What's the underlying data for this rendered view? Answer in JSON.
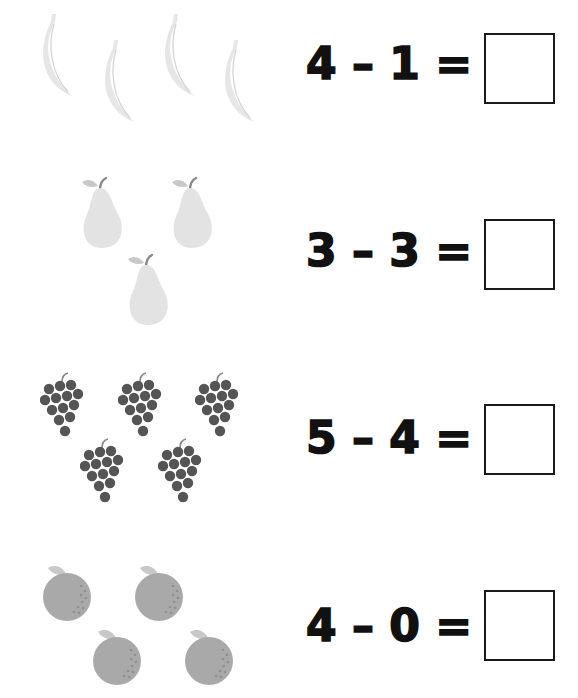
{
  "worksheet": {
    "rows": [
      {
        "fruit": "banana-icon",
        "count": 4,
        "equation": "4 – 1 =",
        "answer": ""
      },
      {
        "fruit": "pear-icon",
        "count": 3,
        "equation": "3 – 3 =",
        "answer": ""
      },
      {
        "fruit": "grapes-icon",
        "count": 5,
        "equation": "5 – 4 =",
        "answer": ""
      },
      {
        "fruit": "orange-icon",
        "count": 4,
        "equation": "4 – 0 =",
        "answer": ""
      }
    ]
  },
  "colors": {
    "banana": "#e6e6e6",
    "pear": "#e3e3e3",
    "grapes": "#555555",
    "orange": "#a9a9a9",
    "leaf": "#c8c8c8",
    "stem": "#8a8a8a",
    "ink": "#111111"
  }
}
